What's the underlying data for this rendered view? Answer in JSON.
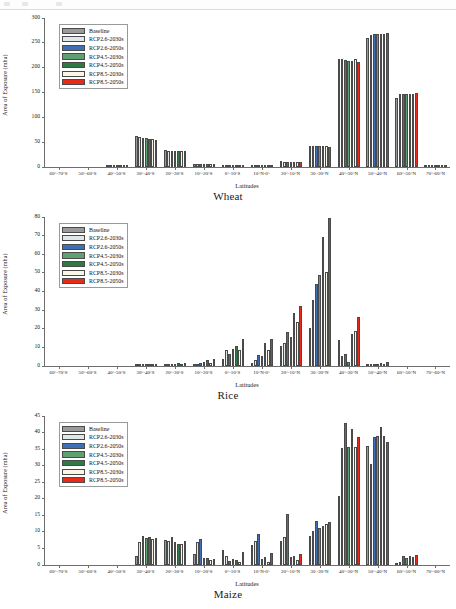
{
  "figure": {
    "xlabel": "Latitudes",
    "ylabel": "Area of Exposure (mha)",
    "categories": [
      "60°-70°S",
      "50°-60°S",
      "40°-50°S",
      "30°-40°S",
      "20°-30°S",
      "10°-20°S",
      "0°-10°S",
      "10°N-0°",
      "20°-10°N",
      "30 -20°N",
      "40°-30°N",
      "50°-40°N",
      "60°-50°N",
      "70°-60°N"
    ],
    "series_names": [
      "Baseline",
      "RCP2.6-2030s",
      "RCP2.6-2050s",
      "RCP4.5-2030s",
      "RCP4.5-2050s",
      "RCP8.5-2030s",
      "RCP8.5-2050s"
    ],
    "series_colors": [
      "#9a9a9a",
      "#dfe7e9",
      "#3f6fb5",
      "#5f9f72",
      "#2f7a44",
      "#fbf7e8",
      "#e82a18"
    ]
  },
  "panels": [
    {
      "caption": "Wheat",
      "chart_data": {
        "type": "bar",
        "title": "Wheat",
        "xlabel": "Latitudes",
        "ylabel": "Area of Exposure (mha)",
        "ylim": [
          0,
          300
        ],
        "yticks": [
          0,
          50,
          100,
          150,
          200,
          250,
          300
        ],
        "grid": false,
        "legend_position": "upper-left",
        "categories": [
          "60°-70°S",
          "50°-60°S",
          "40°-50°S",
          "30°-40°S",
          "20°-30°S",
          "10°-20°S",
          "0°-10°S",
          "10°N-0°",
          "20°-10°N",
          "30 -20°N",
          "40°-30°N",
          "50°-40°N",
          "60°-50°N",
          "70°-60°N"
        ],
        "series": [
          {
            "name": "Baseline",
            "values": [
              0,
              0,
              0.3,
              62,
              35,
              5.5,
              1.2,
              2.0,
              11.5,
              42,
              216,
              258,
              139,
              0.4
            ]
          },
          {
            "name": "RCP2.6-2030s",
            "values": [
              0,
              0,
              0.3,
              61,
              33,
              5.5,
              1.2,
              2.2,
              10.5,
              42,
              217,
              264,
              146,
              0.4
            ]
          },
          {
            "name": "RCP2.6-2050s",
            "values": [
              0,
              0,
              0.3,
              59,
              33,
              5.5,
              1.2,
              2.4,
              10.5,
              42,
              214,
              266,
              146,
              0.4
            ]
          },
          {
            "name": "RCP4.5-2030s",
            "values": [
              0,
              0,
              0.3,
              59,
              33,
              5.5,
              1.3,
              2.4,
              10.5,
              43,
              213,
              266,
              146,
              0.4
            ]
          },
          {
            "name": "RCP4.5-2050s",
            "values": [
              0,
              0,
              0.3,
              57,
              32,
              5.6,
              1.3,
              2.6,
              10.5,
              43,
              213,
              266,
              147,
              0.4
            ]
          },
          {
            "name": "RCP8.5-2030s",
            "values": [
              0,
              0,
              0.3,
              57,
              33,
              5.6,
              1.3,
              2.2,
              10.8,
              42,
              216,
              266,
              147,
              0.4
            ]
          },
          {
            "name": "RCP8.5-2050s",
            "values": [
              0,
              0,
              0.3,
              54,
              32,
              6.0,
              1.4,
              1.8,
              9.5,
              40,
              210,
              269,
              149,
              0.4
            ]
          }
        ]
      }
    },
    {
      "caption": "Rice",
      "chart_data": {
        "type": "bar",
        "title": "Rice",
        "xlabel": "Latitudes",
        "ylabel": "Area of Exposure (mha)",
        "ylim": [
          0,
          80
        ],
        "yticks": [
          0,
          10,
          20,
          30,
          40,
          50,
          60,
          70,
          80
        ],
        "grid": false,
        "legend_position": "upper-left",
        "categories": [
          "60°-70°S",
          "50°-60°S",
          "40°-50°S",
          "30°-40°S",
          "20°-30°S",
          "10°-20°S",
          "0°-10°S",
          "10°N-0°",
          "20°-10°N",
          "30 -20°N",
          "40°-30°N",
          "50°-40°N",
          "60°-50°N",
          "70°-60°N"
        ],
        "series": [
          {
            "name": "Baseline",
            "values": [
              0,
              0,
              0,
              0.5,
              0.6,
              0.9,
              3.5,
              1.7,
              10.8,
              20.4,
              13.8,
              0.6,
              0,
              0
            ]
          },
          {
            "name": "RCP2.6-2030s",
            "values": [
              0,
              0,
              0,
              0.5,
              0.8,
              1.3,
              8.6,
              3.1,
              12.2,
              35.2,
              5.4,
              0.8,
              0,
              0
            ]
          },
          {
            "name": "RCP2.6-2050s",
            "values": [
              0,
              0,
              0,
              0.5,
              0.9,
              1.5,
              6.2,
              5.9,
              18.4,
              43.7,
              6.4,
              1.1,
              0,
              0
            ]
          },
          {
            "name": "RCP4.5-2030s",
            "values": [
              0,
              0,
              0,
              0.5,
              1.3,
              2.0,
              9.0,
              5.5,
              15.3,
              48.3,
              2.3,
              1.2,
              0,
              0
            ]
          },
          {
            "name": "RCP4.5-2050s",
            "values": [
              0,
              0,
              0,
              0.6,
              1.6,
              3.0,
              10.8,
              12.2,
              28.3,
              69.0,
              16.9,
              1.6,
              0,
              0
            ]
          },
          {
            "name": "RCP8.5-2030s",
            "values": [
              0,
              0,
              0,
              0.5,
              1.1,
              1.6,
              8.4,
              8.6,
              23.6,
              50.0,
              18.9,
              1.3,
              0,
              0
            ]
          },
          {
            "name": "RCP8.5-2050s",
            "values": [
              0,
              0,
              0,
              0.7,
              1.5,
              3.6,
              14.2,
              14.2,
              32.0,
              78.8,
              26.0,
              2.0,
              0,
              0
            ]
          }
        ]
      }
    },
    {
      "caption": "Maize",
      "chart_data": {
        "type": "bar",
        "title": "Maize",
        "xlabel": "Latitudes",
        "ylabel": "Area of Exposure (mha)",
        "ylim": [
          0,
          45
        ],
        "yticks": [
          0,
          5,
          10,
          15,
          20,
          25,
          30,
          35,
          40,
          45
        ],
        "grid": false,
        "legend_position": "upper-left",
        "categories": [
          "60°-70°S",
          "50°-60°S",
          "40°-50°S",
          "30°-40°S",
          "20°-30°S",
          "10°-20°S",
          "0°-10°S",
          "10°N-0°",
          "20°-10°N",
          "30 -20°N",
          "40°-30°N",
          "50°-40°N",
          "60°-50°N",
          "70°-60°N"
        ],
        "series": [
          {
            "name": "Baseline",
            "values": [
              0,
              0,
              0,
              2.6,
              7.6,
              3.4,
              4.5,
              6.1,
              7.3,
              8.8,
              20.7,
              35.8,
              0.1,
              0
            ]
          },
          {
            "name": "RCP2.6-2030s",
            "values": [
              0,
              0,
              0,
              7.0,
              7.2,
              6.9,
              2.8,
              7.1,
              8.4,
              10.2,
              35.0,
              30.2,
              0.9,
              0
            ]
          },
          {
            "name": "RCP2.6-2050s",
            "values": [
              0,
              0,
              0,
              8.7,
              8.3,
              7.7,
              1.2,
              9.4,
              15.3,
              13.1,
              42.5,
              38.5,
              2.6,
              0
            ]
          },
          {
            "name": "RCP4.5-2030s",
            "values": [
              0,
              0,
              0,
              8.1,
              6.9,
              2.0,
              1.7,
              1.8,
              2.4,
              11.2,
              35.4,
              38.8,
              2.2,
              0
            ]
          },
          {
            "name": "RCP4.5-2050s",
            "values": [
              0,
              0,
              0,
              8.3,
              6.3,
              2.0,
              1.6,
              2.3,
              2.6,
              11.7,
              40.7,
              41.5,
              2.6,
              0
            ]
          },
          {
            "name": "RCP8.5-2030s",
            "values": [
              0,
              0,
              0,
              7.9,
              6.4,
              1.6,
              1.0,
              1.0,
              1.4,
              12.2,
              35.3,
              38.6,
              2.3,
              0
            ]
          },
          {
            "name": "RCP8.5-2050s",
            "values": [
              0,
              0,
              0,
              8.2,
              7.2,
              1.8,
              3.9,
              3.5,
              3.3,
              12.8,
              38.3,
              36.8,
              3.1,
              0
            ]
          }
        ]
      }
    }
  ]
}
